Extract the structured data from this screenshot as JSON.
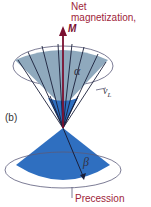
{
  "labels": {
    "net_line1": "Net",
    "net_line2": "magnetization,",
    "m_symbol": "M",
    "alpha": "α",
    "beta": "β",
    "nu": "ν",
    "nu_sub": "L",
    "panel": "(b)",
    "precession": "Precession"
  },
  "colors": {
    "upper_cone": "#8fa9bd",
    "lower_cone": "#2f6fc0",
    "arrow": "#1a1f3a",
    "m_arrow": "#7a1030",
    "text_accent": "#a0243a",
    "ellipse": "#5a5a7a"
  }
}
